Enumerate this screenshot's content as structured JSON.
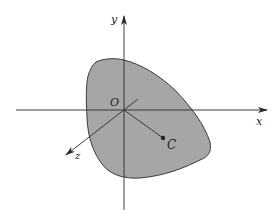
{
  "diagram": {
    "type": "3d-coordinate-system-with-region",
    "axes": {
      "x_label": "x",
      "y_label": "y",
      "z_label": "z",
      "origin_label": "O"
    },
    "point": {
      "label": "C"
    },
    "colors": {
      "region_fill": "#a6a6a6",
      "line": "#2a2a2a",
      "background": "#ffffff"
    }
  }
}
